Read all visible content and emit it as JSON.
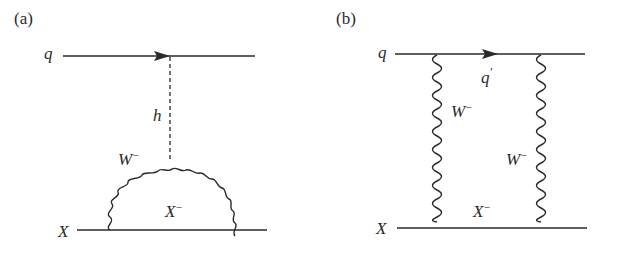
{
  "panels": [
    {
      "id": "a",
      "label": "(a)",
      "quark_in": "q",
      "higgs": "h",
      "boson": "W",
      "boson_charge": "−",
      "fermion_loop": "X",
      "fermion_loop_charge": "−",
      "external_fermion": "X"
    },
    {
      "id": "b",
      "label": "(b)",
      "quark_in": "q",
      "quark_internal": "q",
      "quark_internal_prime": "′",
      "boson_left": "W",
      "boson_left_charge": "−",
      "boson_right": "W",
      "boson_right_charge": "−",
      "fermion_internal": "X",
      "fermion_internal_charge": "−",
      "external_fermion": "X"
    }
  ],
  "colors": {
    "line": "#2a2a2a",
    "background": "#ffffff"
  }
}
